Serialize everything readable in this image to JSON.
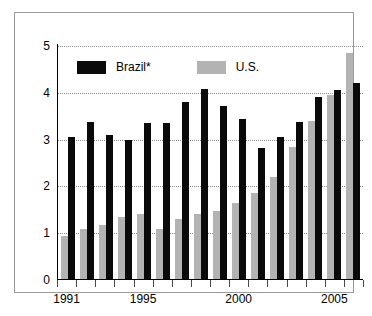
{
  "chart_data": {
    "type": "bar",
    "title": "",
    "subtitle": "",
    "xlabel": "",
    "ylabel": "",
    "ylim": [
      0,
      5
    ],
    "yticks": [
      0,
      1,
      2,
      3,
      4,
      5
    ],
    "grid": true,
    "legend_position": "top-left",
    "categories": [
      "1991",
      "1992",
      "1993",
      "1994",
      "1995",
      "1996",
      "1997",
      "1998",
      "1999",
      "2000",
      "2001",
      "2002",
      "2003",
      "2004",
      "2005",
      "2006"
    ],
    "xtick_labels": [
      "1991",
      "1995",
      "2000",
      "2005"
    ],
    "xtick_label_years": [
      1991,
      1995,
      2000,
      2005
    ],
    "series": [
      {
        "name": "U.S.",
        "color": "#b3b3b3",
        "values": [
          0.95,
          1.1,
          1.17,
          1.35,
          1.42,
          1.1,
          1.3,
          1.42,
          1.48,
          1.65,
          1.85,
          2.2,
          2.85,
          3.4,
          3.95,
          4.85
        ]
      },
      {
        "name": "Brazil*",
        "color": "#0a0a0a",
        "values": [
          3.05,
          3.38,
          3.1,
          3.0,
          3.35,
          3.35,
          3.8,
          4.08,
          3.72,
          3.45,
          2.82,
          3.05,
          3.37,
          3.92,
          4.07,
          4.22
        ]
      }
    ]
  },
  "legend": {
    "items": [
      {
        "label": "Brazil*",
        "color": "#0a0a0a",
        "key": "brazil"
      },
      {
        "label": "U.S.",
        "color": "#b3b3b3",
        "key": "us"
      }
    ]
  },
  "axis": {
    "y_labels": [
      "5",
      "4",
      "3",
      "2",
      "1",
      "0"
    ],
    "x_labels": [
      "1991",
      "1995",
      "2000",
      "2005"
    ]
  },
  "colors": {
    "brazil": "#0a0a0a",
    "us": "#b3b3b3",
    "grid": "#8c8c8c",
    "frame": "#9a9a9a",
    "background": "#ffffff",
    "text": "#000000"
  }
}
